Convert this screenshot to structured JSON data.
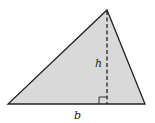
{
  "diagram": {
    "shape": "triangle",
    "fill_color": "#d9d9d9",
    "stroke_color": "#222222",
    "vertices": [
      [
        8,
        104
      ],
      [
        145,
        104
      ],
      [
        107,
        10
      ]
    ],
    "labels": {
      "base": "b",
      "height": "h"
    },
    "height_line": {
      "style": "dashed",
      "x": 107,
      "y1": 10,
      "y2": 104
    },
    "right_angle_marker": true
  }
}
